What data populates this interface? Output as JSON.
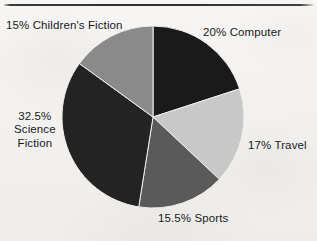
{
  "page": {
    "background_color": "#f4f3f1",
    "rule_color": "#2e2e2e"
  },
  "chart_data": {
    "type": "pie",
    "title": "",
    "subtitle": "",
    "xlabel": "",
    "ylabel": "",
    "legend_position": "none",
    "grid": false,
    "units": "percent",
    "total": 100,
    "start_angle_deg": 0,
    "direction": "clockwise",
    "center": {
      "x": 153,
      "y": 117
    },
    "radius": 91,
    "categories": [
      "Computer",
      "Travel",
      "Sports",
      "Science Fiction",
      "Children's Fiction"
    ],
    "values": [
      20,
      17,
      15.5,
      32.5,
      15
    ],
    "slices": [
      {
        "name": "Computer",
        "value": 20,
        "label": "20% Computer",
        "color": "#1a1a1a",
        "start_deg": 0,
        "end_deg": 72
      },
      {
        "name": "Travel",
        "value": 17,
        "label": "17% Travel",
        "color": "#c8c8c8",
        "start_deg": 72,
        "end_deg": 133.2
      },
      {
        "name": "Sports",
        "value": 15.5,
        "label": "15.5% Sports",
        "color": "#5a5a5a",
        "start_deg": 133.2,
        "end_deg": 189
      },
      {
        "name": "Science Fiction",
        "value": 32.5,
        "label": "32.5%\nScience\nFiction",
        "color": "#232323",
        "start_deg": 189,
        "end_deg": 306
      },
      {
        "name": "Children's Fiction",
        "value": 15,
        "label": "15% Children's Fiction",
        "color": "#8a8a8a",
        "start_deg": 306,
        "end_deg": 360
      }
    ]
  }
}
